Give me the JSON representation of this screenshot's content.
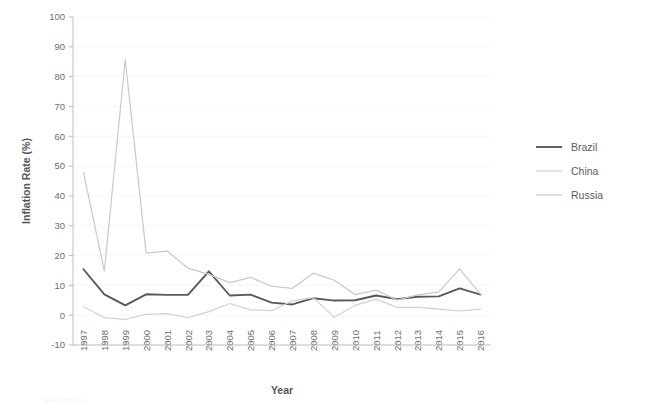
{
  "chart_data": {
    "type": "line",
    "title": "",
    "xlabel": "Year",
    "ylabel": "Inflation Rate (%)",
    "x": [
      1997,
      1998,
      1999,
      2000,
      2001,
      2002,
      2003,
      2004,
      2005,
      2006,
      2007,
      2008,
      2009,
      2010,
      2011,
      2012,
      2013,
      2014,
      2015,
      2016
    ],
    "categories": [
      "1997",
      "1998",
      "1999",
      "2000",
      "2001",
      "2002",
      "2003",
      "2004",
      "2005",
      "2006",
      "2007",
      "2008",
      "2009",
      "2010",
      "2011",
      "2012",
      "2013",
      "2014",
      "2015",
      "2016"
    ],
    "xlim": [
      1996.5,
      2016.5
    ],
    "ylim": [
      -10,
      100
    ],
    "yticks": [
      -10,
      0,
      10,
      20,
      30,
      40,
      50,
      60,
      70,
      80,
      90,
      100
    ],
    "ytick_labels": [
      "-10",
      "0",
      "10",
      "20",
      "30",
      "40",
      "50",
      "60",
      "70",
      "80",
      "90",
      "100"
    ],
    "grid": true,
    "grid_axis": "y",
    "legend_position": "right",
    "series": [
      {
        "name": "Brazil",
        "color": "#595959",
        "width": 1.9,
        "values": [
          15.4,
          7.0,
          3.3,
          7.0,
          6.8,
          6.8,
          14.7,
          6.6,
          6.9,
          4.2,
          3.6,
          5.7,
          4.9,
          5.0,
          6.6,
          5.4,
          6.2,
          6.3,
          9.0,
          6.9
        ]
      },
      {
        "name": "China",
        "color": "#d2d2d2",
        "width": 1.2,
        "values": [
          2.8,
          -0.8,
          -1.4,
          0.3,
          0.5,
          -0.8,
          1.2,
          3.9,
          1.8,
          1.5,
          4.8,
          5.9,
          -0.7,
          3.3,
          5.4,
          2.6,
          2.6,
          2.0,
          1.4,
          2.0
        ]
      },
      {
        "name": "Russia",
        "color": "#c9c9c9",
        "width": 1.2,
        "values": [
          48.0,
          14.8,
          85.7,
          20.8,
          21.5,
          15.8,
          13.7,
          10.9,
          12.7,
          9.7,
          9.0,
          14.1,
          11.7,
          6.9,
          8.4,
          5.1,
          6.8,
          7.8,
          15.5,
          7.0
        ]
      }
    ]
  },
  "legend": {
    "items": [
      {
        "label": "Brazil"
      },
      {
        "label": "China"
      },
      {
        "label": "Russia"
      }
    ]
  },
  "footnote": {
    "text": "1997-2016"
  }
}
